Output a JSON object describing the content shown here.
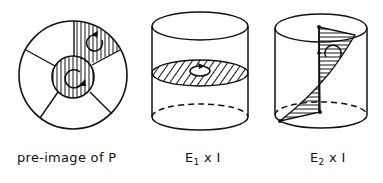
{
  "figure": {
    "panels": [
      {
        "id": "pre-image",
        "caption": "pre-image of P",
        "description": "disk divided into five sectors around a central disk; central disk and one upper-right sector hatched with vertical lines, each containing a circular orientation arrow"
      },
      {
        "id": "e1-times-i",
        "caption_base": "E",
        "caption_subscript": "1",
        "caption_rest": " x I",
        "description": "cylinder with a horizontal hatched disk slice containing a small oriented circle"
      },
      {
        "id": "e2-times-i",
        "caption_base": "E",
        "caption_subscript": "2",
        "caption_rest": " x I",
        "description": "cylinder with a twisted hatched strip running from top to bottom, with an orientation arrow"
      }
    ],
    "colors": {
      "ink": "#111111",
      "background": "#ffffff"
    }
  }
}
